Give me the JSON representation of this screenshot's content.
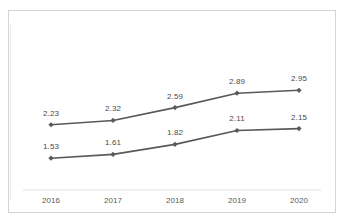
{
  "chart_data": {
    "type": "line",
    "title": "",
    "subtitle": "",
    "xlabel": "",
    "ylabel": "",
    "categories": [
      "2016",
      "2017",
      "2018",
      "2019",
      "2020"
    ],
    "series": [
      {
        "name": "series-upper",
        "values": [
          2.23,
          2.32,
          2.59,
          2.89,
          2.95
        ],
        "labels": [
          "2.23",
          "2.32",
          "2.59",
          "2.89",
          "2.95"
        ],
        "color": "#595959",
        "marker": "diamond"
      },
      {
        "name": "series-lower",
        "values": [
          1.53,
          1.61,
          1.82,
          2.11,
          2.15
        ],
        "labels": [
          "1.53",
          "1.61",
          "1.82",
          "2.11",
          "2.15"
        ],
        "color": "#595959",
        "marker": "diamond"
      }
    ],
    "ylim": [
      1.2,
      3.25
    ],
    "grid": false,
    "legend": "none",
    "axis_line_color": "#e0e0e0",
    "border_color": "#d4d4d4",
    "label_color": "#4a4a4a",
    "tick_color": "#5a5a5a"
  },
  "axis": {
    "ticks": [
      {
        "label": "2016"
      },
      {
        "label": "2017"
      },
      {
        "label": "2018"
      },
      {
        "label": "2019"
      },
      {
        "label": "2020"
      }
    ]
  }
}
